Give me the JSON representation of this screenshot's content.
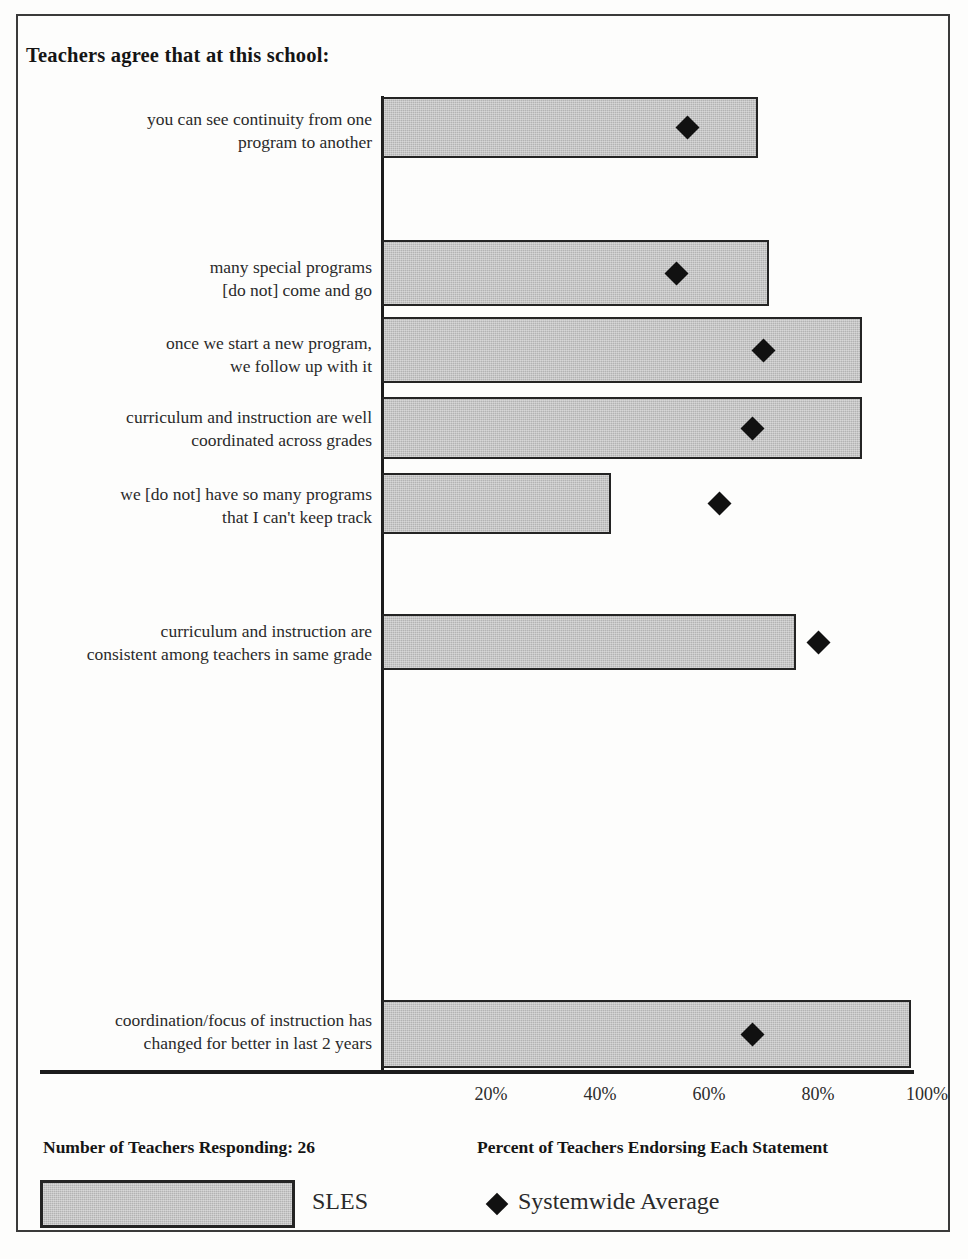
{
  "title": "Teachers agree that at this school:",
  "footer": {
    "respondents": "Number of Teachers Responding: 26",
    "axis_caption": "Percent of Teachers Endorsing Each Statement"
  },
  "legend": {
    "bar_label": "SLES",
    "marker_label": "Systemwide Average"
  },
  "chart_data": {
    "type": "bar",
    "orientation": "horizontal",
    "title": "Teachers agree that at this school:",
    "xlabel": "Percent of Teachers Endorsing Each Statement",
    "ylabel": "",
    "xlim": [
      0,
      100
    ],
    "grid": false,
    "legend_position": "bottom",
    "tick_labels": [
      "20%",
      "40%",
      "60%",
      "80%",
      "100%"
    ],
    "tick_values": [
      20,
      40,
      60,
      80,
      100
    ],
    "categories": [
      "you can see continuity from one\nprogram to another",
      "many special programs\n[do not] come and go",
      "once we start a new program,\nwe follow up with it",
      "curriculum and instruction are well\ncoordinated across grades",
      "we [do not] have so many programs\nthat I can't keep track",
      "curriculum and instruction are\nconsistent among teachers in same grade",
      "coordination/focus of instruction has\nchanged for better in last 2 years"
    ],
    "series": [
      {
        "name": "SLES",
        "type": "bar",
        "values": [
          69,
          71,
          88,
          88,
          42,
          76,
          97
        ]
      },
      {
        "name": "Systemwide Average",
        "type": "marker",
        "marker": "diamond",
        "values": [
          56,
          54,
          70,
          68,
          62,
          80,
          68
        ]
      }
    ],
    "rows": [
      {
        "label_line1": "you can see continuity from one",
        "label_line2": "program to another",
        "bar_value": 69,
        "marker_value": 56,
        "bar_top": 97,
        "bar_height": 61,
        "label_top": 108
      },
      {
        "label_line1": "many special programs",
        "label_line2": "[do not] come and go",
        "bar_value": 71,
        "marker_value": 54,
        "bar_top": 240,
        "bar_height": 66,
        "label_top": 256
      },
      {
        "label_line1": "once we start a new program,",
        "label_line2": "we follow up with it",
        "bar_value": 88,
        "marker_value": 70,
        "bar_top": 317,
        "bar_height": 66,
        "label_top": 332
      },
      {
        "label_line1": "curriculum and instruction are well",
        "label_line2": "coordinated across grades",
        "bar_value": 88,
        "marker_value": 68,
        "bar_top": 397,
        "bar_height": 62,
        "label_top": 406
      },
      {
        "label_line1": "we [do not] have so many programs",
        "label_line2": "that I can't keep track",
        "bar_value": 42,
        "marker_value": 62,
        "bar_top": 473,
        "bar_height": 61,
        "label_top": 483
      },
      {
        "label_line1": "curriculum and instruction are",
        "label_line2": "consistent among teachers in same grade",
        "bar_value": 76,
        "marker_value": 80,
        "bar_top": 614,
        "bar_height": 56,
        "label_top": 620
      },
      {
        "label_line1": "coordination/focus of instruction has",
        "label_line2": "changed for better in last 2 years",
        "bar_value": 97,
        "marker_value": 68,
        "bar_top": 1000,
        "bar_height": 68,
        "label_top": 1009
      }
    ],
    "colors": {
      "bar_fill": "#b3b3b3",
      "bar_edge": "#242424",
      "marker": "#111111",
      "axis": "#1c1c1c",
      "background": "#fdfdfc"
    }
  }
}
